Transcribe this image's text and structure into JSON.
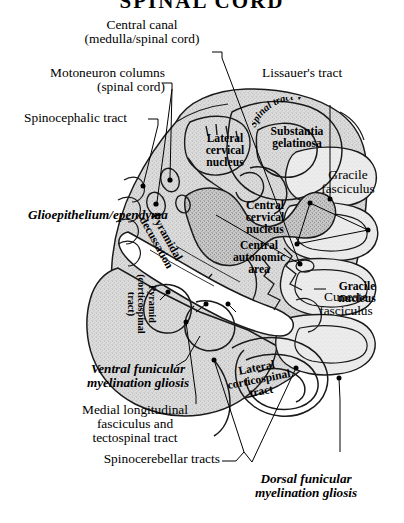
{
  "figure": {
    "title": "SPINAL CORD",
    "background_color": "#ffffff",
    "tissue_color": "#d8d8d8",
    "line_color": "#000000"
  },
  "callout_labels": [
    {
      "id": "central-canal",
      "text": "Central canal\n(medulla/spinal cord)",
      "align": "center"
    },
    {
      "id": "motoneuron-columns",
      "text": "Motoneuron columns\n(spinal cord)",
      "align": "right"
    },
    {
      "id": "spinocephalic-tract",
      "text": "Spinocephalic tract",
      "align": "left"
    },
    {
      "id": "lissauers-tract",
      "text": "Lissauer's tract",
      "align": "left"
    },
    {
      "id": "gracile-fasciculus",
      "text": "Gracile\nfasciculus",
      "align": "center"
    },
    {
      "id": "gracile-nucleus",
      "text": "Gracile\nnucleus",
      "align": "center"
    },
    {
      "id": "cuneate-fasciculus",
      "text": "Cuneate\nfasciculus",
      "align": "center"
    },
    {
      "id": "medial-longitudinal",
      "text": "Medial longitudinal\nfasciculus and\ntectospinal tract",
      "align": "center"
    },
    {
      "id": "spinocerebellar",
      "text": "Spinocerebellar tracts",
      "align": "right"
    }
  ],
  "italic_labels": [
    {
      "id": "glioepithelium",
      "text": "Glioepithelium/ependyma"
    },
    {
      "id": "ventral-funicular",
      "text": "Ventral funicular\nmyelination gliosis"
    },
    {
      "id": "dorsal-funicular",
      "text": "Dorsal funicular\nmyelination gliosis"
    }
  ],
  "inner_labels": [
    {
      "id": "lateral-cervical-nucleus",
      "text": "Lateral\ncervical\nnucleus"
    },
    {
      "id": "substantia-gelatinosa",
      "text": "Substantia\ngelatinosa"
    },
    {
      "id": "spinal-tract-v",
      "text": "Spinal tract V"
    },
    {
      "id": "central-cervical-nucleus",
      "text": "Central\ncervical\nnucleus"
    },
    {
      "id": "central-autonomic-area",
      "text": "Central\nautonomic\narea"
    },
    {
      "id": "pyramidal-decussation",
      "text": "Pyramidal\ndecussation"
    },
    {
      "id": "pyramid-corticospinal",
      "text": "Pyramid\n(corticospinal\ntract)"
    },
    {
      "id": "lateral-corticospinal",
      "text": "Lateral\ncorticospinal\ntract"
    }
  ]
}
